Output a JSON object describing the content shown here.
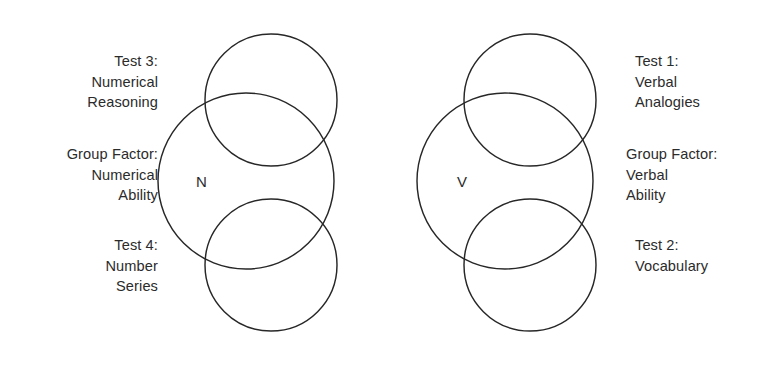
{
  "figure": {
    "background_color": "#ffffff",
    "stroke_color": "#272727",
    "text_color": "#2b2b2b",
    "width": 758,
    "height": 365
  },
  "groups": {
    "numerical": {
      "factor_letter": "N",
      "captions": {
        "test_upper": {
          "line1": "Test 3:",
          "line2": "Numerical",
          "line3": "Reasoning"
        },
        "group_factor": {
          "line1": "Group Factor:",
          "line2": "Numerical",
          "line3": "Ability"
        },
        "test_lower": {
          "line1": "Test 4:",
          "line2": "Number",
          "line3": "Series"
        }
      }
    },
    "verbal": {
      "factor_letter": "V",
      "captions": {
        "test_upper": {
          "line1": "Test 1:",
          "line2": "Verbal",
          "line3": "Analogies"
        },
        "group_factor": {
          "line1": "Group Factor:",
          "line2": "Verbal",
          "line3": "Ability"
        },
        "test_lower": {
          "line1": "Test 2:",
          "line2": "Vocabulary",
          "line3": ""
        }
      }
    }
  },
  "chart_data": {
    "type": "diagram",
    "subtype": "venn",
    "title": "",
    "circles": [
      {
        "id": "numerical-group-factor",
        "group": "numerical",
        "role": "group-factor",
        "label": "N",
        "cx": 246,
        "cy": 181,
        "r": 88
      },
      {
        "id": "numerical-test-upper",
        "group": "numerical",
        "role": "test",
        "label": "Test 3",
        "cx": 271,
        "cy": 100,
        "r": 66
      },
      {
        "id": "numerical-test-lower",
        "group": "numerical",
        "role": "test",
        "label": "Test 4",
        "cx": 271,
        "cy": 265,
        "r": 66
      },
      {
        "id": "verbal-group-factor",
        "group": "verbal",
        "role": "group-factor",
        "label": "V",
        "cx": 505,
        "cy": 181,
        "r": 88
      },
      {
        "id": "verbal-test-upper",
        "group": "verbal",
        "role": "test",
        "label": "Test 1",
        "cx": 530,
        "cy": 100,
        "r": 66
      },
      {
        "id": "verbal-test-lower",
        "group": "verbal",
        "role": "test",
        "label": "Test 2",
        "cx": 530,
        "cy": 265,
        "r": 66
      }
    ]
  }
}
